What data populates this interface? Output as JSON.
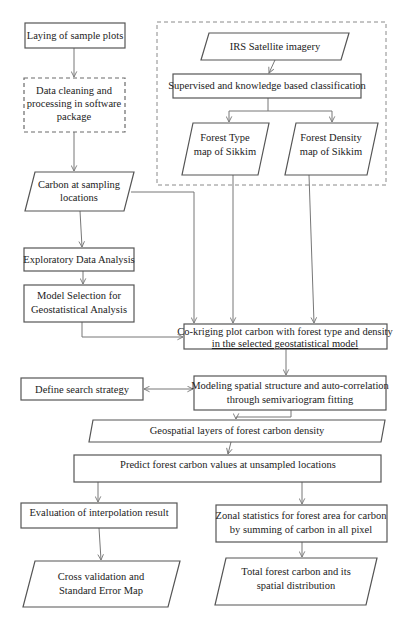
{
  "diagram": {
    "type": "flowchart",
    "nodes": [
      {
        "id": "laying",
        "shape": "rect",
        "lines": [
          "Laying of sample plots"
        ]
      },
      {
        "id": "cleaning",
        "shape": "dashed-rect",
        "lines": [
          "Data cleaning and",
          "processing in software",
          "package"
        ]
      },
      {
        "id": "carbon_sampling",
        "shape": "parallelogram",
        "lines": [
          "Carbon at sampling",
          "locations"
        ]
      },
      {
        "id": "eda",
        "shape": "rect",
        "lines": [
          "Exploratory Data Analysis"
        ]
      },
      {
        "id": "model_selection",
        "shape": "rect",
        "lines": [
          "Model Selection for",
          "Geostatistical Analysis"
        ]
      },
      {
        "id": "irs",
        "shape": "parallelogram",
        "lines": [
          "IRS Satellite imagery"
        ]
      },
      {
        "id": "classification",
        "shape": "rect",
        "lines": [
          "Supervised and knowledge based classification"
        ]
      },
      {
        "id": "forest_type",
        "shape": "parallelogram",
        "lines": [
          "Forest  Type",
          "map of Sikkim"
        ]
      },
      {
        "id": "forest_density",
        "shape": "parallelogram",
        "lines": [
          "Forest  Density",
          "map of Sikkim"
        ]
      },
      {
        "id": "cokriging",
        "shape": "rect",
        "lines": [
          "Co-kriging plot carbon with forest type and density",
          "in the selected geostatistical model"
        ]
      },
      {
        "id": "modeling",
        "shape": "rect",
        "lines": [
          "Modeling spatial structure and auto-correlation",
          "through semivariogram fitting"
        ]
      },
      {
        "id": "search",
        "shape": "rect",
        "lines": [
          "Define search strategy"
        ]
      },
      {
        "id": "geospatial",
        "shape": "parallelogram",
        "lines": [
          "Geospatial layers of forest carbon density"
        ]
      },
      {
        "id": "predict",
        "shape": "rect",
        "lines": [
          "Predict forest carbon values at unsampled locations"
        ]
      },
      {
        "id": "evaluation",
        "shape": "rect",
        "lines": [
          "Evaluation of interpolation result"
        ]
      },
      {
        "id": "zonal",
        "shape": "rect",
        "lines": [
          "Zonal statistics for forest area for carbon",
          "by summing of carbon in all pixel"
        ]
      },
      {
        "id": "cross_validation",
        "shape": "parallelogram",
        "lines": [
          "Cross validation and",
          "Standard Error Map"
        ]
      },
      {
        "id": "total_carbon",
        "shape": "parallelogram",
        "lines": [
          "Total forest carbon and its",
          "spatial distribution"
        ]
      }
    ],
    "groups": [
      {
        "id": "remote_sensing_group",
        "members": [
          "irs",
          "classification",
          "forest_type",
          "forest_density"
        ],
        "style": "dashed"
      }
    ],
    "edges": [
      {
        "from": "laying",
        "to": "cleaning"
      },
      {
        "from": "cleaning",
        "to": "carbon_sampling"
      },
      {
        "from": "carbon_sampling",
        "to": "eda"
      },
      {
        "from": "eda",
        "to": "model_selection"
      },
      {
        "from": "carbon_sampling",
        "to": "cokriging"
      },
      {
        "from": "model_selection",
        "to": "cokriging"
      },
      {
        "from": "irs",
        "to": "classification"
      },
      {
        "from": "classification",
        "to": "forest_type"
      },
      {
        "from": "classification",
        "to": "forest_density"
      },
      {
        "from": "forest_type",
        "to": "cokriging"
      },
      {
        "from": "forest_density",
        "to": "cokriging"
      },
      {
        "from": "cokriging",
        "to": "modeling"
      },
      {
        "from": "search",
        "to": "modeling",
        "bidirectional": true
      },
      {
        "from": "modeling",
        "to": "geospatial"
      },
      {
        "from": "geospatial",
        "to": "predict"
      },
      {
        "from": "predict",
        "to": "evaluation"
      },
      {
        "from": "predict",
        "to": "zonal"
      },
      {
        "from": "evaluation",
        "to": "cross_validation"
      },
      {
        "from": "zonal",
        "to": "total_carbon"
      }
    ]
  }
}
